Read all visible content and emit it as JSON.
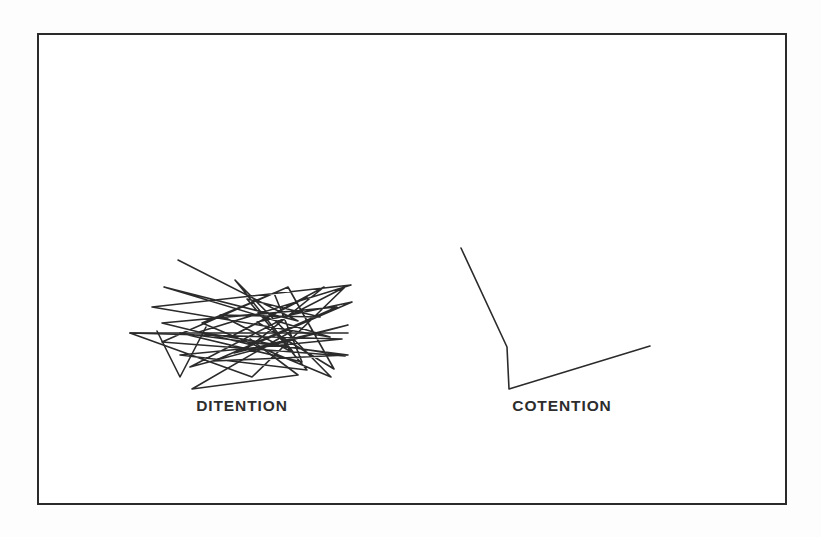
{
  "page": {
    "background_color": "#fdfdfd",
    "width": 821,
    "height": 537
  },
  "frame": {
    "border_color": "#2b2b2b",
    "fill_color": "#ffffff",
    "border_width": 2
  },
  "figures": [
    {
      "id": "ditention",
      "label": "DITENTION",
      "stroke_color": "#2b2b2b",
      "stroke_width": 1.6,
      "description": "dense scribble of many overlapping straight zigzag segments",
      "points": [
        [
          76,
          33
        ],
        [
          196,
          94
        ],
        [
          62,
          60
        ],
        [
          228,
          110
        ],
        [
          50,
          80
        ],
        [
          249,
          58
        ],
        [
          97,
          105
        ],
        [
          243,
          129
        ],
        [
          60,
          115
        ],
        [
          186,
          60
        ],
        [
          232,
          142
        ],
        [
          155,
          95
        ],
        [
          250,
          75
        ],
        [
          132,
          126
        ],
        [
          246,
          98
        ],
        [
          88,
          140
        ],
        [
          243,
          60
        ],
        [
          150,
          150
        ],
        [
          28,
          106
        ],
        [
          240,
          112
        ],
        [
          78,
          128
        ],
        [
          205,
          143
        ],
        [
          145,
          72
        ],
        [
          218,
          90
        ],
        [
          118,
          88
        ],
        [
          192,
          126
        ],
        [
          133,
          53
        ],
        [
          229,
          150
        ],
        [
          100,
          96
        ],
        [
          172,
          66
        ],
        [
          200,
          135
        ],
        [
          78,
          106
        ],
        [
          246,
          128
        ],
        [
          112,
          134
        ],
        [
          235,
          80
        ],
        [
          60,
          96
        ],
        [
          150,
          118
        ],
        [
          222,
          60
        ],
        [
          132,
          108
        ],
        [
          205,
          70
        ]
      ],
      "tail_points": [
        [
          28,
          106
        ],
        [
          246,
          106
        ]
      ],
      "spike_points": [
        [
          55,
          104
        ],
        [
          78,
          150
        ],
        [
          104,
          100
        ]
      ],
      "spike2_points": [
        [
          148,
          112
        ],
        [
          196,
          148
        ],
        [
          90,
          162
        ],
        [
          190,
          104
        ]
      ]
    },
    {
      "id": "cotention",
      "label": "COTENTION",
      "stroke_color": "#2b2b2b",
      "stroke_width": 1.6,
      "description": "simple open polyline: a long diagonal down-left, a short vertical drop, then a long diagonal up-right",
      "points": [
        [
          29,
          21
        ],
        [
          75,
          120
        ],
        [
          77,
          162
        ],
        [
          218,
          119
        ]
      ]
    }
  ]
}
